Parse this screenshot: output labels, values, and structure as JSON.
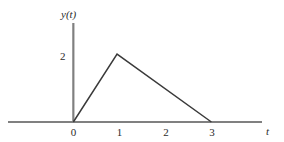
{
  "figure": {
    "width": 284,
    "height": 142,
    "background": "#ffffff",
    "axis_color": "#808080",
    "curve_color": "#3a3a3a",
    "text_color": "#2b2b2b"
  },
  "chart_data": {
    "type": "line",
    "title": "",
    "subtitle": "",
    "xlabel": "t",
    "ylabel": "y(t)",
    "x": [
      0,
      0.95,
      3
    ],
    "values": [
      0,
      2,
      0
    ],
    "series": [
      {
        "name": "y(t)",
        "x": [
          0,
          0.95,
          3
        ],
        "values": [
          0,
          2,
          0
        ]
      }
    ],
    "xlim": [
      -1.42,
      4.1
    ],
    "ylim": [
      0,
      2.92
    ],
    "xticks": [
      0,
      1,
      2,
      3
    ],
    "xtick_labels": [
      "0",
      "1",
      "2",
      "3"
    ],
    "yticks": [
      2
    ],
    "ytick_labels": [
      "2"
    ],
    "grid": false,
    "legend": false,
    "legend_position": "none",
    "annotations": []
  },
  "labels": {
    "y_axis_name": "y(t)",
    "x_axis_name": "t",
    "y_tick_2": "2",
    "x_tick_0": "0",
    "x_tick_1": "1",
    "x_tick_2": "2",
    "x_tick_3": "3"
  }
}
